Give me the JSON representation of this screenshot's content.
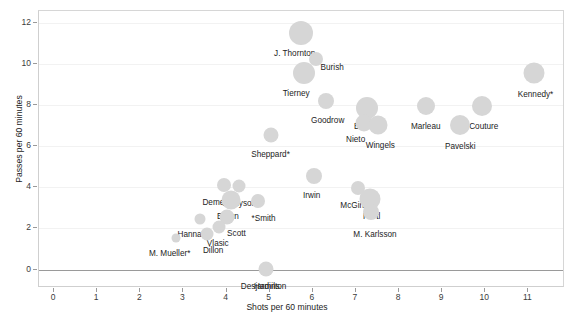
{
  "chart_data": {
    "type": "scatter",
    "title": "",
    "xlabel": "Shots per 60 minutes",
    "ylabel": "Passes per 60 minutes",
    "xlim": [
      -0.35,
      11.85
    ],
    "ylim": [
      -0.9,
      12.6
    ],
    "xticks": [
      "0",
      "1",
      "2",
      "3",
      "4",
      "5",
      "6",
      "7",
      "8",
      "9",
      "10",
      "11"
    ],
    "xtick_values": [
      0,
      1,
      2,
      3,
      4,
      5,
      6,
      7,
      8,
      9,
      10,
      11
    ],
    "yticks": [
      "0",
      "2",
      "4",
      "6",
      "8",
      "10",
      "12"
    ],
    "ytick_values": [
      0,
      2,
      4,
      6,
      8,
      10,
      12
    ],
    "grid": true,
    "legend": "none",
    "marker_color": "#d6d6d6",
    "zero_reference_line": 0,
    "points": [
      {
        "label": "J. Thornton",
        "x": 5.72,
        "y": 11.55,
        "size": 24,
        "label_dx": -6,
        "label_dy": 16
      },
      {
        "label": "Burish",
        "x": 6.08,
        "y": 10.25,
        "size": 14,
        "label_dx": 16,
        "label_dy": 4
      },
      {
        "label": "Tierney",
        "x": 5.8,
        "y": 9.6,
        "size": 22,
        "label_dx": -8,
        "label_dy": 16
      },
      {
        "label": "Goodrow",
        "x": 6.3,
        "y": 8.2,
        "size": 16,
        "label_dx": 2,
        "label_dy": 15
      },
      {
        "label": "Burns",
        "x": 7.25,
        "y": 7.85,
        "size": 22,
        "label_dx": -2,
        "label_dy": 14
      },
      {
        "label": "Nieto",
        "x": 7.18,
        "y": 7.15,
        "size": 17,
        "label_dx": -8,
        "label_dy": 12
      },
      {
        "label": "Wingels",
        "x": 7.52,
        "y": 7.05,
        "size": 19,
        "label_dx": 2,
        "label_dy": 16
      },
      {
        "label": "Marleau",
        "x": 8.62,
        "y": 7.95,
        "size": 18,
        "label_dx": 0,
        "label_dy": 16
      },
      {
        "label": "Couture",
        "x": 9.92,
        "y": 7.95,
        "size": 20,
        "label_dx": 2,
        "label_dy": 16
      },
      {
        "label": "Pavelski",
        "x": 9.42,
        "y": 7.05,
        "size": 20,
        "label_dx": 0,
        "label_dy": 17
      },
      {
        "label": "Kennedy*",
        "x": 11.12,
        "y": 9.6,
        "size": 21,
        "label_dx": 2,
        "label_dy": 17
      },
      {
        "label": "Sheppard*",
        "x": 5.02,
        "y": 6.55,
        "size": 15,
        "label_dx": 0,
        "label_dy": 15
      },
      {
        "label": "Irwin",
        "x": 6.02,
        "y": 4.55,
        "size": 16,
        "label_dx": -2,
        "label_dy": 15
      },
      {
        "label": "McGinn*",
        "x": 7.05,
        "y": 3.95,
        "size": 14,
        "label_dx": -2,
        "label_dy": 13
      },
      {
        "label": "Hertl",
        "x": 7.32,
        "y": 3.45,
        "size": 21,
        "label_dx": 2,
        "label_dy": 13
      },
      {
        "label": "M. Karlsson",
        "x": 7.35,
        "y": 2.8,
        "size": 16,
        "label_dx": 4,
        "label_dy": 18
      },
      {
        "label": "Tennyson",
        "x": 4.28,
        "y": 4.05,
        "size": 13,
        "label_dx": 0,
        "label_dy": 13
      },
      {
        "label": "*Smith",
        "x": 4.72,
        "y": 3.32,
        "size": 14,
        "label_dx": 6,
        "label_dy": 13
      },
      {
        "label": "Demers*",
        "x": 3.95,
        "y": 4.12,
        "size": 14,
        "label_dx": -6,
        "label_dy": 13
      },
      {
        "label": "Braun",
        "x": 4.1,
        "y": 3.4,
        "size": 19,
        "label_dx": -3,
        "label_dy": 12
      },
      {
        "label": "Scott",
        "x": 4.02,
        "y": 2.55,
        "size": 15,
        "label_dx": 9,
        "label_dy": 12
      },
      {
        "label": "Hannan",
        "x": 3.38,
        "y": 2.48,
        "size": 11,
        "label_dx": -8,
        "label_dy": 11
      },
      {
        "label": "Vlasic",
        "x": 3.82,
        "y": 2.05,
        "size": 13,
        "label_dx": -1,
        "label_dy": 12
      },
      {
        "label": "Dillon",
        "x": 3.55,
        "y": 1.72,
        "size": 13,
        "label_dx": 6,
        "label_dy": 12
      },
      {
        "label": "M. Mueller*",
        "x": 2.82,
        "y": 1.55,
        "size": 9,
        "label_dx": -6,
        "label_dy": 11
      },
      {
        "label": "Hamilton",
        "x": 4.92,
        "y": 0.05,
        "size": 15,
        "label_dx": 4,
        "label_dy": 13
      },
      {
        "label": "Desjardins",
        "x": 4.92,
        "y": 0.05,
        "size": 0,
        "label_dx": -6,
        "label_dy": 13
      }
    ]
  }
}
